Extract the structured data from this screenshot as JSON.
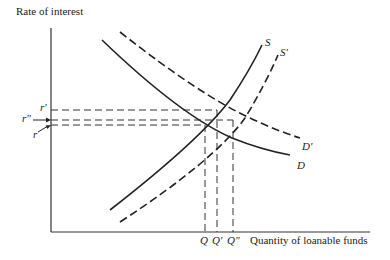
{
  "diagram": {
    "type": "supply-demand",
    "y_axis_label": "Rate of interest",
    "x_axis_label": "Quantity of loanable funds",
    "curves": [
      {
        "name": "S",
        "style": "solid",
        "label": "S"
      },
      {
        "name": "S'",
        "style": "dashed",
        "label": "S'"
      },
      {
        "name": "D",
        "style": "solid",
        "label": "D"
      },
      {
        "name": "D'",
        "style": "dashed",
        "label": "D'"
      }
    ],
    "rate_labels": {
      "r_prime": "r'",
      "r_double": "r\"",
      "r": "r"
    },
    "quantity_labels": {
      "q": "Q",
      "q_prime": "Q'",
      "q_double": "Q\""
    }
  }
}
